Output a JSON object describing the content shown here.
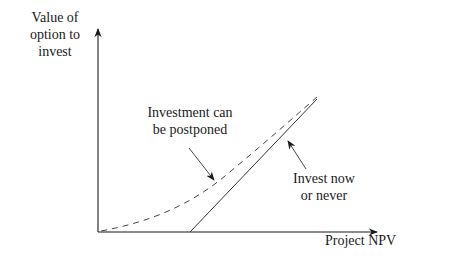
{
  "diagram": {
    "type": "option-value-vs-npv",
    "y_axis": {
      "label_lines": [
        "Value of",
        "option to",
        "invest"
      ]
    },
    "x_axis": {
      "label": "Project NPV"
    },
    "curves": [
      {
        "name": "postponable",
        "style": "dashed",
        "label_lines": [
          "Investment can",
          "be postponed"
        ]
      },
      {
        "name": "now-or-never",
        "style": "solid",
        "label_lines": [
          "Invest now",
          "or never"
        ]
      }
    ],
    "colors": {
      "ink": "#1a1a1a",
      "background": "#ffffff"
    }
  }
}
